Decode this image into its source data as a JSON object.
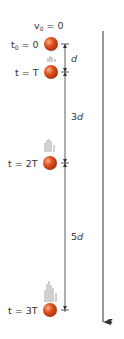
{
  "labels": {
    "v0": "v",
    "v0_sub": "0",
    "v0_eq": " = 0",
    "t0": "t",
    "t0_sub": "0",
    "t0_eq": " = 0",
    "t1": "t = T",
    "t2": "t = 2T",
    "t3": "t = 3T",
    "d1": "d",
    "d2_num": "3",
    "d2_var": "d",
    "d3_num": "5",
    "d3_var": "d",
    "axis": "s"
  },
  "colors": {
    "ball": "#d8461a",
    "ball_highlight": "#f4a27a",
    "line": "#555555"
  }
}
